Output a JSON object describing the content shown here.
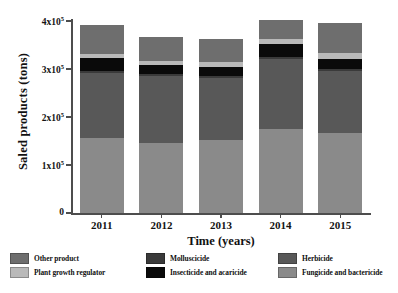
{
  "chart_data": {
    "type": "bar",
    "subtype": "stacked",
    "title": "",
    "xlabel": "Time (years)",
    "ylabel": "Saled products (tons)",
    "categories": [
      "2011",
      "2012",
      "2013",
      "2014",
      "2015"
    ],
    "ylim": [
      0,
      400000
    ],
    "ytick_values": [
      0,
      100000,
      200000,
      300000,
      400000
    ],
    "ytick_labels": [
      "0",
      "1x10⁵",
      "2x10⁵",
      "3x10⁵",
      "4x10⁵"
    ],
    "grid": false,
    "legend_position": "below-axes",
    "series": [
      {
        "name": "Fungicide and bactericide",
        "color": "#8a8a8a",
        "values": [
          156000,
          146000,
          152000,
          176000,
          166000
        ]
      },
      {
        "name": "Herbicide",
        "color": "#585858",
        "values": [
          135000,
          139000,
          130000,
          144000,
          130000
        ]
      },
      {
        "name": "Molluscicide",
        "color": "#3a3a3a",
        "values": [
          4000,
          4000,
          4000,
          4000,
          4000
        ]
      },
      {
        "name": "Insecticide and acaricide",
        "color": "#0a0a0a",
        "values": [
          27000,
          19000,
          19000,
          29000,
          21000
        ]
      },
      {
        "name": "Plant growth regulator",
        "color": "#b9b9b9",
        "values": [
          9000,
          8000,
          10000,
          9000,
          12000
        ]
      },
      {
        "name": "Other product",
        "color": "#6e6e6e",
        "values": [
          61000,
          51000,
          48000,
          40000,
          62000
        ]
      }
    ],
    "totals": [
      392000,
      367000,
      363000,
      402000,
      395000
    ]
  },
  "legend": {
    "items": [
      {
        "label": "Other product",
        "color": "#6e6e6e"
      },
      {
        "label": "Plant growth regulator",
        "color": "#b9b9b9"
      },
      {
        "label": "Molluscicide",
        "color": "#3a3a3a"
      },
      {
        "label": "Insecticide and acaricide",
        "color": "#0a0a0a"
      },
      {
        "label": "Herbicide",
        "color": "#585858"
      },
      {
        "label": "Fungicide and bactericide",
        "color": "#8a8a8a"
      }
    ]
  },
  "axes": {
    "y_title": "Saled products (tons)",
    "x_title": "Time (years)"
  }
}
